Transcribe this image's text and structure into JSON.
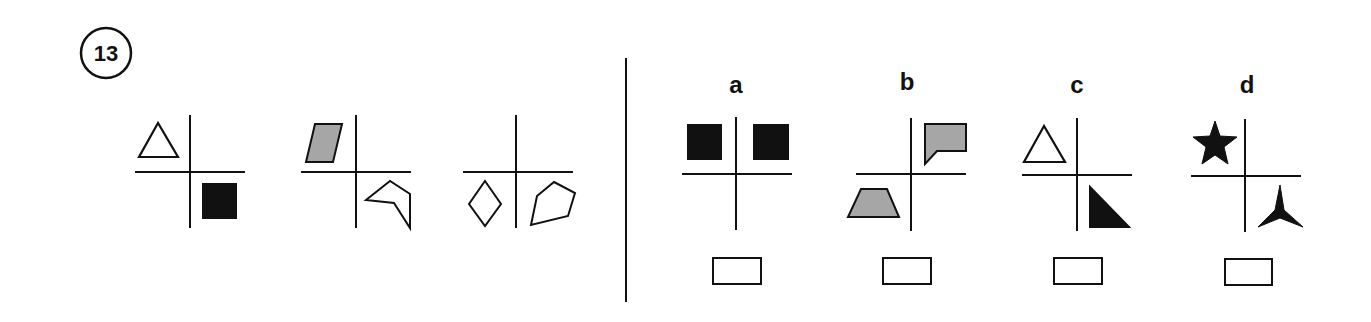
{
  "question": {
    "number": "13",
    "sequence": [
      {
        "top_left": "outline-triangle",
        "bottom_right": "black-square"
      },
      {
        "top_left": "gray-parallelogram",
        "bottom_right": "outline-concave-pentagon"
      },
      {
        "bottom_left": "outline-diamond",
        "bottom_right": "outline-pentagon"
      }
    ]
  },
  "options": [
    {
      "label": "a",
      "shapes": [
        "black-square top-left",
        "black-square top-right"
      ]
    },
    {
      "label": "b",
      "shapes": [
        "gray-notched-flag top-right",
        "gray-trapezoid bottom-left"
      ]
    },
    {
      "label": "c",
      "shapes": [
        "outline-triangle top-left",
        "black-right-triangle bottom-right"
      ]
    },
    {
      "label": "d",
      "shapes": [
        "black-star top-left",
        "black-three-point-star bottom-right"
      ]
    }
  ],
  "colors": {
    "ink": "#111111",
    "gray_fill": "#a6a6a6",
    "background": "#ffffff"
  }
}
